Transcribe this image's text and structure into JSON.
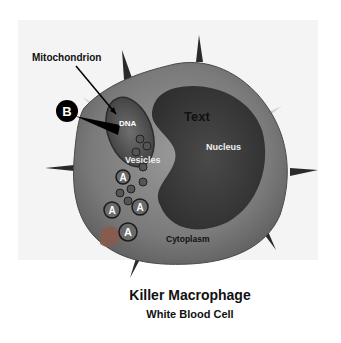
{
  "diagram": {
    "title": "Killer Macrophage",
    "subtitle": "White Blood Cell",
    "labels": {
      "mitochondrion": "Mitochondrion",
      "dna": "DNA",
      "text": "Text",
      "nucleus": "Nucleus",
      "vesicles": "Vesicles",
      "cytoplasm": "Cytoplasm"
    },
    "markers": {
      "b": "B",
      "a1": "A",
      "a2": "A",
      "a3": "A",
      "a4": "A"
    }
  }
}
